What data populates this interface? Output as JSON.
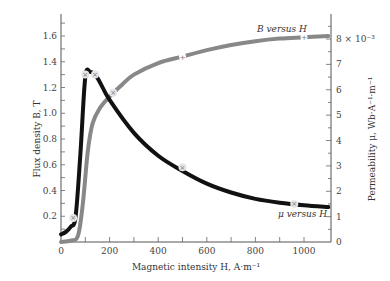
{
  "chart_data": {
    "type": "line",
    "title": "",
    "xlabel": "Magnetic intensity H, A·m⁻¹",
    "ylabel": "Flux density B, T",
    "y2label": "Permeability μ, Wb·A⁻¹·m⁻¹",
    "xlim": [
      0,
      1100
    ],
    "ylim": [
      0,
      1.8
    ],
    "y2lim": [
      0,
      8.5
    ],
    "y2_scale_note": "× 10⁻³",
    "xticks": [
      "0",
      "200",
      "400",
      "600",
      "800",
      "1000"
    ],
    "yticks": [
      "0.2",
      "0.4",
      "0.6",
      "0.8",
      "1.0",
      "1.2",
      "1.4",
      "1.6"
    ],
    "y2ticks": [
      "0",
      "1",
      "2",
      "3",
      "4",
      "5",
      "6",
      "7",
      "8 × 10⁻³"
    ],
    "grid": false,
    "series": [
      {
        "name": "B versus H",
        "axis": "left",
        "color": "#888888",
        "x": [
          0,
          40,
          70,
          90,
          110,
          130,
          160,
          200,
          250,
          300,
          400,
          500,
          600,
          700,
          800,
          900,
          1000,
          1100
        ],
        "y": [
          0.0,
          0.01,
          0.05,
          0.3,
          0.7,
          0.92,
          1.04,
          1.13,
          1.22,
          1.3,
          1.39,
          1.44,
          1.49,
          1.53,
          1.56,
          1.58,
          1.59,
          1.6
        ]
      },
      {
        "name": "μ versus H",
        "axis": "right",
        "color": "#111111",
        "x": [
          0,
          20,
          40,
          60,
          80,
          100,
          120,
          140,
          160,
          200,
          300,
          400,
          500,
          600,
          700,
          800,
          900,
          1000,
          1100
        ],
        "y": [
          0.3,
          0.4,
          0.6,
          1.0,
          3.5,
          6.5,
          6.7,
          6.6,
          6.3,
          5.6,
          4.3,
          3.4,
          2.8,
          2.3,
          1.95,
          1.7,
          1.55,
          1.45,
          1.38
        ]
      }
    ],
    "annotations": [
      "B versus H",
      "μ versus H"
    ]
  },
  "labels": {
    "xlabel": "Magnetic intensity H, A·m⁻¹",
    "ylabel": "Flux density B, T",
    "y2label": "Permeability μ, Wb·A⁻¹·m⁻¹",
    "b_curve": "B versus H",
    "mu_curve": "μ versus H"
  }
}
